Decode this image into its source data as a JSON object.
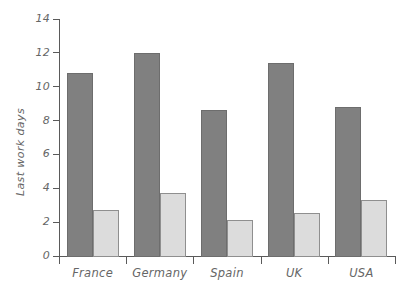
{
  "chart_data": {
    "type": "bar",
    "title": "",
    "xlabel": "",
    "ylabel": "Last work days",
    "categories": [
      "France",
      "Germany",
      "Spain",
      "UK",
      "USA"
    ],
    "series": [
      {
        "name": "series-1",
        "color": "#808080",
        "values": [
          10.8,
          12.0,
          8.6,
          11.4,
          8.8
        ]
      },
      {
        "name": "series-2",
        "color": "#dcdcdc",
        "values": [
          2.7,
          3.7,
          2.1,
          2.55,
          3.3
        ]
      }
    ],
    "ylim": [
      0,
      14
    ],
    "ytick_step": 2,
    "ytick_labels": [
      "0",
      "2",
      "4",
      "6",
      "8",
      "10",
      "12",
      "14"
    ],
    "grid": false,
    "legend": "none",
    "axis_color": "#5a5a5a",
    "label_color": "#666666",
    "background": "#ffffff"
  }
}
